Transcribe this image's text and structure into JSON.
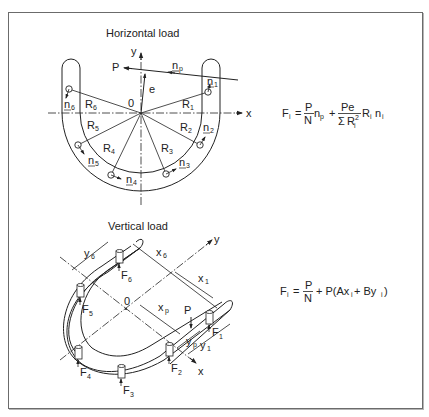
{
  "horizontal": {
    "title": "Horizontal load",
    "axis_x": "x",
    "axis_y": "y",
    "origin": "0",
    "load": "P",
    "eccentricity": "e",
    "np": {
      "base": "n",
      "sub": "p"
    },
    "radii": [
      {
        "base": "R",
        "sub": "1"
      },
      {
        "base": "R",
        "sub": "2"
      },
      {
        "base": "R",
        "sub": "3"
      },
      {
        "base": "R",
        "sub": "4"
      },
      {
        "base": "R",
        "sub": "5"
      },
      {
        "base": "R",
        "sub": "6"
      }
    ],
    "normals": [
      {
        "base": "n",
        "sub": "1"
      },
      {
        "base": "n",
        "sub": "2"
      },
      {
        "base": "n",
        "sub": "3"
      },
      {
        "base": "n",
        "sub": "4"
      },
      {
        "base": "n",
        "sub": "5"
      },
      {
        "base": "n",
        "sub": "6"
      }
    ],
    "equation": {
      "lhs": "F",
      "lhs_sub": "i",
      "eq": "=",
      "frac1_num": "P",
      "frac1_den": "N",
      "t1": "n",
      "t1_sub": "p",
      "plus": "+",
      "frac2_num": "Pe",
      "frac2_den_sigma": "Σ",
      "frac2_den": "R",
      "frac2_den_sub": "i",
      "frac2_den_sup": "2",
      "t2": "R",
      "t2_sub": "i",
      "t3": "n",
      "t3_sub": "i"
    }
  },
  "vertical": {
    "title": "Vertical load",
    "axis_x": "x",
    "axis_y": "y",
    "origin": "0",
    "load": "P",
    "dims": {
      "x6": {
        "base": "x",
        "sub": "6"
      },
      "x1": {
        "base": "x",
        "sub": "1"
      },
      "xp": {
        "base": "x",
        "sub": "p"
      },
      "y6": {
        "base": "y",
        "sub": "6"
      },
      "yp": {
        "base": "y",
        "sub": "p"
      },
      "y1": {
        "base": "y",
        "sub": "1"
      }
    },
    "forces": [
      {
        "base": "F",
        "sub": "1"
      },
      {
        "base": "F",
        "sub": "2"
      },
      {
        "base": "F",
        "sub": "3"
      },
      {
        "base": "F",
        "sub": "4"
      },
      {
        "base": "F",
        "sub": "5"
      },
      {
        "base": "F",
        "sub": "6"
      }
    ],
    "equation": {
      "lhs": "F",
      "lhs_sub": "i",
      "eq": "=",
      "frac_num": "P",
      "frac_den": "N",
      "rest_a": "+ P(Ax",
      "rest_a_sub": "i",
      "rest_b": " + By",
      "rest_b_sub": "i",
      "rest_c": ")"
    }
  }
}
